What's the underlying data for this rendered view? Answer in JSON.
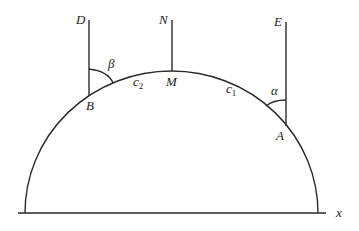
{
  "diagram": {
    "title": "",
    "colors": {
      "line": "#2a2a2a",
      "text": "#222222",
      "background": "#ffffff"
    },
    "labels": {
      "D": "D",
      "N": "N",
      "E": "E",
      "B": "B",
      "M": "M",
      "A": "A",
      "beta": "β",
      "alpha": "α",
      "c2_base": "c",
      "c2_sub": "2",
      "c1_base": "c",
      "c1_sub": "1",
      "x_axis": "x"
    },
    "elements": {
      "baseline": "horizontal x-axis",
      "arc": "semicircular arc",
      "vertical_lines": [
        "BD",
        "MN",
        "AE"
      ],
      "angles": [
        "beta at B between BD and arc",
        "alpha at A between AE and arc"
      ]
    }
  }
}
